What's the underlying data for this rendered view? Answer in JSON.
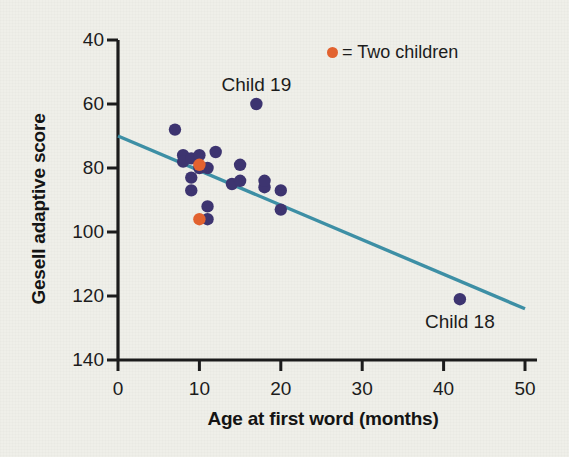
{
  "chart_data": {
    "type": "scatter",
    "title": "",
    "xlabel": "Age at first word (months)",
    "ylabel": "Gesell adaptive score",
    "xlim": [
      0,
      50
    ],
    "ylim": [
      40,
      140
    ],
    "xticks": [
      0,
      10,
      20,
      30,
      40,
      50
    ],
    "yticks": [
      40,
      60,
      80,
      100,
      120,
      140
    ],
    "grid": false,
    "legend_position": "top-right",
    "legend": [
      {
        "marker_color": "#e2622f",
        "label": "= Two children"
      }
    ],
    "series": [
      {
        "name": "Children (single)",
        "marker_color": "#3d3470",
        "points": [
          {
            "x": 7,
            "y": 112
          },
          {
            "x": 8,
            "y": 104
          },
          {
            "x": 8,
            "y": 102
          },
          {
            "x": 9,
            "y": 103
          },
          {
            "x": 9,
            "y": 97
          },
          {
            "x": 9,
            "y": 93
          },
          {
            "x": 10,
            "y": 100
          },
          {
            "x": 10,
            "y": 104
          },
          {
            "x": 11,
            "y": 100
          },
          {
            "x": 11,
            "y": 88
          },
          {
            "x": 11,
            "y": 84
          },
          {
            "x": 12,
            "y": 105
          },
          {
            "x": 14,
            "y": 95
          },
          {
            "x": 15,
            "y": 96
          },
          {
            "x": 15,
            "y": 101
          },
          {
            "x": 17,
            "y": 120
          },
          {
            "x": 18,
            "y": 94
          },
          {
            "x": 18,
            "y": 96
          },
          {
            "x": 20,
            "y": 93
          },
          {
            "x": 20,
            "y": 87
          },
          {
            "x": 42,
            "y": 59
          }
        ]
      },
      {
        "name": "Two children (overlapping)",
        "marker_color": "#e2622f",
        "points": [
          {
            "x": 10,
            "y": 101
          },
          {
            "x": 10,
            "y": 84
          }
        ]
      }
    ],
    "regression_line": {
      "color": "#3d8fa5",
      "x_start": 0,
      "y_start": 110,
      "x_end": 50,
      "y_end": 56
    },
    "annotations": [
      {
        "text": "Child 19",
        "x": 17,
        "y": 126,
        "name": "annotation-child-19"
      },
      {
        "text": "Child 18",
        "x": 42,
        "y": 52,
        "name": "annotation-child-18"
      }
    ]
  },
  "axes": {
    "y_tick_labels": [
      "140",
      "120",
      "100",
      "80",
      "60",
      "40"
    ],
    "x_tick_labels": [
      "0",
      "10",
      "20",
      "30",
      "40",
      "50"
    ],
    "y_title": "Gesell adaptive score",
    "x_title": "Age at first word (months)"
  },
  "legend_text": "= Two children",
  "colors": {
    "background": "#efefe9",
    "marker_single": "#3d3470",
    "marker_double": "#e2622f",
    "regression": "#3d8fa5",
    "axis": "#1c1c1c"
  }
}
